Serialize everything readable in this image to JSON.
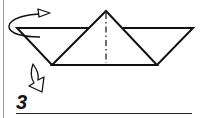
{
  "diagram": {
    "step_number": "3",
    "instructions": [
      {
        "type": "turn-over-arrow",
        "meaning": "turn model over"
      },
      {
        "type": "fold-arrow",
        "meaning": "fold down"
      }
    ],
    "shape": {
      "top_edge": {
        "x1": 17,
        "y1": 28,
        "x2": 193,
        "y2": 28
      },
      "bottom_edge": {
        "x1": 52,
        "y1": 65,
        "x2": 157,
        "y2": 65
      },
      "peak": {
        "x": 106,
        "y": 11
      },
      "center_line": "dash-dot vertical"
    },
    "colors": {
      "stroke": "#111111",
      "fill": "#ffffff",
      "frame": "#999999"
    }
  }
}
